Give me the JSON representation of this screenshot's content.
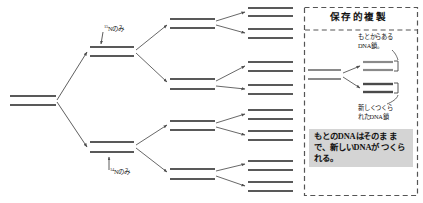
{
  "figure": {
    "type": "diagram",
    "background_color": "#ffffff",
    "strand_color": "#595959",
    "arrow_color": "#4d4d4d",
    "dashed_border_color": "#555555",
    "note_background_color": "#d4d4d4"
  },
  "tree": {
    "labels": {
      "heavy_isotope": "Nのみ",
      "heavy_isotope_sup": "15",
      "light_isotope": "Nのみ",
      "light_isotope_sup": "14"
    },
    "generations": [
      {
        "name": "generation-0",
        "duplex_count": 1,
        "duplexes": [
          {
            "x": 10,
            "y": 96,
            "w": 46
          }
        ]
      },
      {
        "name": "generation-1",
        "duplex_count": 2,
        "duplexes": [
          {
            "x": 90,
            "y": 47,
            "w": 44
          },
          {
            "x": 90,
            "y": 142,
            "w": 44
          }
        ]
      },
      {
        "name": "generation-2",
        "duplex_count": 4,
        "duplexes": [
          {
            "x": 170,
            "y": 19,
            "w": 45
          },
          {
            "x": 170,
            "y": 79,
            "w": 45
          },
          {
            "x": 170,
            "y": 121,
            "w": 45
          },
          {
            "x": 170,
            "y": 169,
            "w": 45
          }
        ]
      },
      {
        "name": "generation-3",
        "duplex_count": 8,
        "duplexes": [
          {
            "x": 248,
            "y": 8,
            "w": 45
          },
          {
            "x": 248,
            "y": 29,
            "w": 45
          },
          {
            "x": 248,
            "y": 62,
            "w": 45
          },
          {
            "x": 248,
            "y": 85,
            "w": 45
          },
          {
            "x": 248,
            "y": 110,
            "w": 45
          },
          {
            "x": 248,
            "y": 131,
            "w": 45
          },
          {
            "x": 248,
            "y": 161,
            "w": 45
          },
          {
            "x": 248,
            "y": 182,
            "w": 45
          }
        ]
      }
    ]
  },
  "panel": {
    "title": "保存的複製",
    "annotations": {
      "old_strand": "もとからある\nDNA鎖。",
      "new_strand": "新しくつくら\nれたDNA鎖"
    },
    "note": "もとのDNAはそのま\nまで、新しいDNAが\nつくられる。",
    "parent_duplex": {
      "x": 308,
      "y": 70,
      "w": 33
    },
    "daughter_duplexes": [
      {
        "x": 363,
        "y": 62,
        "w": 30
      },
      {
        "x": 363,
        "y": 84,
        "w": 30
      }
    ]
  }
}
